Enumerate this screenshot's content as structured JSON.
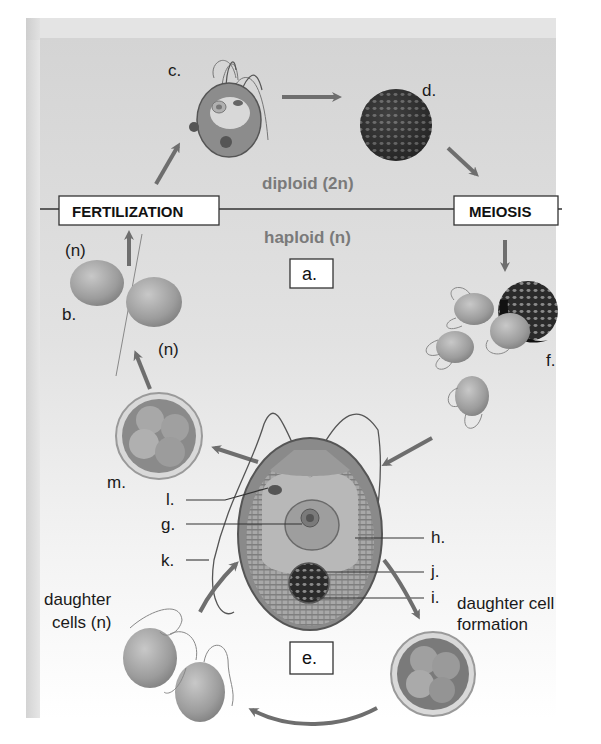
{
  "diagram": {
    "zones": {
      "diploid": "diploid (2n)",
      "haploid": "haploid (n)"
    },
    "stage_boxes": {
      "fertilization": "FERTILIZATION",
      "meiosis": "MEIOSIS"
    },
    "letter_boxes": {
      "a": "a.",
      "e": "e."
    },
    "labels": {
      "b": "b.",
      "c": "c.",
      "d": "d.",
      "f": "f.",
      "g": "g.",
      "h": "h.",
      "i": "i.",
      "j": "j.",
      "k": "k.",
      "l": "l.",
      "m": "m."
    },
    "ploidy_marks": {
      "gamete_top": "(n)",
      "gamete_bottom": "(n)"
    },
    "captions": {
      "daughter_cells_line1": "daughter",
      "daughter_cells_line2": "cells (n)",
      "daughter_formation_line1": "daughter cell",
      "daughter_formation_line2": "formation"
    },
    "colors": {
      "arrow": "#6e6e6e",
      "shade": "#dcdcdc",
      "cell_fill": "#9a9a9a",
      "cell_dark": "#3a3a3a",
      "box_border": "#333333"
    }
  }
}
